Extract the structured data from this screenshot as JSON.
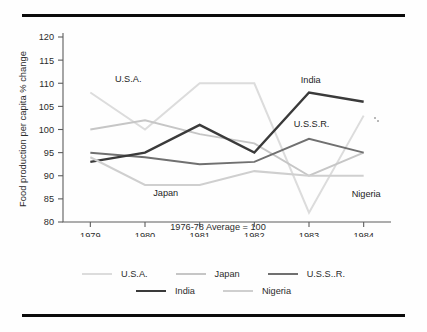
{
  "figure": {
    "top_rule": "horizontal-rule",
    "bottom_rule": "horizontal-rule"
  },
  "chart_data": {
    "type": "line",
    "title": "",
    "subtitle": "",
    "xlabel": "1976-78 Average = 100",
    "ylabel": "Food production per capita % change",
    "x": [
      "1979",
      "1980",
      "1981",
      "1982",
      "1983",
      "1984"
    ],
    "categories": [
      "1979",
      "1980",
      "1981",
      "1982",
      "1983",
      "1984"
    ],
    "xtick_labels": [
      "1979",
      "1980",
      "1981",
      "1982",
      "1983",
      "1984"
    ],
    "ytick_labels": [
      "80",
      "85",
      "90",
      "95",
      "100",
      "105",
      "110",
      "115",
      "120"
    ],
    "yticks": [
      80,
      85,
      90,
      95,
      100,
      105,
      110,
      115,
      120
    ],
    "ylim": [
      80,
      120
    ],
    "grid": false,
    "legend_position": "bottom",
    "series": [
      {
        "name": "U.S.A.",
        "values": [
          108,
          100,
          110,
          110,
          82,
          103
        ],
        "color": "#dcdcdc",
        "width": 2.0
      },
      {
        "name": "Japan",
        "values": [
          100,
          102,
          99,
          97,
          90,
          95
        ],
        "color": "#c6c6c6",
        "width": 2.0
      },
      {
        "name": "U.S.S..R.",
        "values": [
          95,
          94,
          92.5,
          93,
          98,
          95
        ],
        "color": "#707070",
        "width": 2.0
      },
      {
        "name": "India",
        "values": [
          93,
          95,
          101,
          95,
          108,
          106
        ],
        "color": "#3a3a3a",
        "width": 2.4
      },
      {
        "name": "Nigeria",
        "values": [
          94,
          88,
          88,
          91,
          90,
          90
        ],
        "color": "#cfcfcf",
        "width": 2.0
      }
    ],
    "annotations": [
      {
        "text": "U.S.A.",
        "x": 1979.45,
        "y": 110.3
      },
      {
        "text": "Japan",
        "x": 1980.15,
        "y": 85.6
      },
      {
        "text": "India",
        "x": 1982.85,
        "y": 110.1
      },
      {
        "text": "U.S.S.R.",
        "x": 1982.72,
        "y": 100.6
      },
      {
        "text": "Nigeria",
        "x": 1983.78,
        "y": 85.3
      }
    ]
  },
  "legend": {
    "row1": [
      {
        "label": "U.S.A.",
        "color": "#dcdcdc",
        "width": 2.0
      },
      {
        "label": "Japan",
        "color": "#c6c6c6",
        "width": 2.0
      },
      {
        "label": "U.S.S..R.",
        "color": "#707070",
        "width": 2.0
      }
    ],
    "row2": [
      {
        "label": "India",
        "color": "#3a3a3a",
        "width": 2.6
      },
      {
        "label": "Nigeria",
        "color": "#cfcfcf",
        "width": 2.0
      }
    ]
  }
}
